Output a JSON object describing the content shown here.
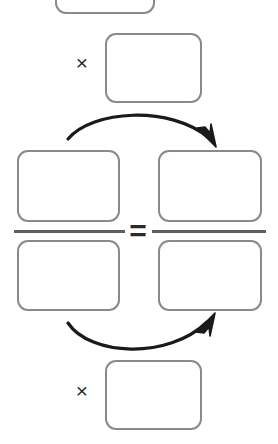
{
  "worksheet": {
    "title": "Cross-multiplication proportion diagram",
    "description": "Blank proportion template: two fractions joined by an equals sign, with curved cross-multiplication arrows leading to multiplication boxes above and below.",
    "background_color": "#ffffff",
    "box_border_color": "#8a8a8a",
    "rule_color": "#5f5f5f",
    "arrow_color": "#1a1a1a",
    "operator_color": "#2b2b2b"
  },
  "operators": {
    "times_top": "×",
    "times_bottom": "×",
    "equals": "=",
    "times_top_name": "multiplication sign",
    "times_bottom_name": "multiplication sign",
    "equals_name": "equals sign"
  },
  "boxes": [
    {
      "id": "top-cropped",
      "label": "",
      "value": "",
      "role": "product-result-top",
      "state": "empty",
      "note": "partially cut off by the top edge of the image"
    },
    {
      "id": "multiplier-top",
      "label": "",
      "value": "",
      "role": "multiplier-top",
      "state": "empty"
    },
    {
      "id": "left-numerator",
      "label": "",
      "value": "",
      "role": "left-fraction-numerator",
      "state": "empty"
    },
    {
      "id": "left-denominator",
      "label": "",
      "value": "",
      "role": "left-fraction-denominator",
      "state": "empty"
    },
    {
      "id": "right-numerator",
      "label": "",
      "value": "",
      "role": "right-fraction-numerator",
      "state": "empty"
    },
    {
      "id": "right-denominator",
      "label": "",
      "value": "",
      "role": "right-fraction-denominator",
      "state": "empty"
    },
    {
      "id": "multiplier-bottom",
      "label": "",
      "value": "",
      "role": "multiplier-bottom",
      "state": "empty"
    }
  ],
  "fraction_bars": [
    {
      "id": "left",
      "label": "",
      "role": "left-fraction-rule"
    },
    {
      "id": "right",
      "label": "",
      "role": "right-fraction-rule"
    }
  ],
  "arrows": [
    {
      "id": "top-arrow",
      "label": "",
      "direction": "left-to-right",
      "curve": "arc-upward",
      "from": "left-numerator",
      "to": "right-numerator",
      "arrowhead": "end"
    },
    {
      "id": "bottom-arrow",
      "label": "",
      "direction": "left-to-right",
      "curve": "arc-downward",
      "from": "left-denominator",
      "to": "right-numerator",
      "arrowhead": "end"
    }
  ]
}
